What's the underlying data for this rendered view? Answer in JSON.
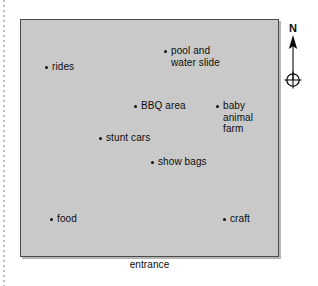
{
  "figure": {
    "kind": "showground-site-map",
    "background_color": "#ffffff",
    "map_fill_color": "#c9c9c9",
    "map_border_color": "#4a4a4a",
    "marker_color": "#101010",
    "text_color": "#0d0d0d"
  },
  "map": {
    "caption": "entrance",
    "markers": [
      {
        "name": "pool-and-water-slide",
        "label": "pool and\nwater slide",
        "dot_x": 164,
        "dot_y": 45
      },
      {
        "name": "rides",
        "label": "rides",
        "dot_x": 45,
        "dot_y": 61
      },
      {
        "name": "bbq-area",
        "label": "BBQ area",
        "dot_x": 134,
        "dot_y": 100
      },
      {
        "name": "baby-animal-farm",
        "label": "baby\nanimal\nfarm",
        "dot_x": 216,
        "dot_y": 100
      },
      {
        "name": "stunt-cars",
        "label": "stunt cars",
        "dot_x": 99,
        "dot_y": 132
      },
      {
        "name": "show-bags",
        "label": "show bags",
        "dot_x": 151,
        "dot_y": 156
      },
      {
        "name": "food",
        "label": "food",
        "dot_x": 50,
        "dot_y": 213
      },
      {
        "name": "craft",
        "label": "craft",
        "dot_x": 223,
        "dot_y": 213
      }
    ]
  },
  "compass": {
    "north_label": "N"
  }
}
